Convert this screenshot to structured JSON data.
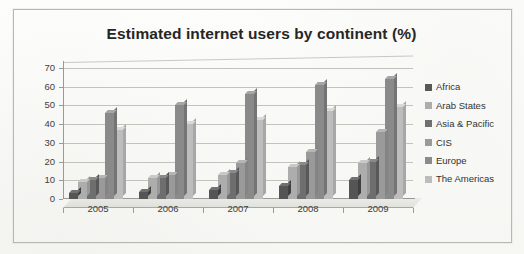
{
  "figure": {
    "title": "Estimated internet users by continent (%)"
  },
  "chart_data": {
    "type": "bar",
    "title": "Estimated internet users by continent (%)",
    "xlabel": "",
    "ylabel": "",
    "categories": [
      "2005",
      "2006",
      "2007",
      "2008",
      "2009"
    ],
    "ylim": [
      0,
      70
    ],
    "yticks": [
      0,
      10,
      20,
      30,
      40,
      50,
      60,
      70
    ],
    "ytick_labels": [
      "0",
      "10",
      "20",
      "30",
      "40",
      "50",
      "60",
      "70"
    ],
    "grid": true,
    "legend_position": "right",
    "series": [
      {
        "name": "Africa",
        "color": "#555555",
        "values": [
          3,
          4,
          5,
          7,
          10
        ]
      },
      {
        "name": "Arab States",
        "color": "#adadad",
        "values": [
          9,
          11,
          13,
          17,
          19
        ]
      },
      {
        "name": "Asia & Pacific",
        "color": "#6e6e6e",
        "values": [
          10,
          11,
          14,
          18,
          20
        ]
      },
      {
        "name": "CIS",
        "color": "#9a9a9a",
        "values": [
          11,
          13,
          19,
          25,
          36
        ]
      },
      {
        "name": "Europe",
        "color": "#8a8a8a",
        "values": [
          46,
          50,
          56,
          61,
          64
        ]
      },
      {
        "name": "The Americas",
        "color": "#bdbdbd",
        "values": [
          37,
          40,
          42,
          47,
          49
        ]
      }
    ]
  },
  "legend": {
    "items": [
      {
        "label": "Africa",
        "color": "#555555"
      },
      {
        "label": "Arab States",
        "color": "#adadad"
      },
      {
        "label": "Asia & Pacific",
        "color": "#6e6e6e"
      },
      {
        "label": "CIS",
        "color": "#9a9a9a"
      },
      {
        "label": "Europe",
        "color": "#8a8a8a"
      },
      {
        "label": "The Americas",
        "color": "#bdbdbd"
      }
    ]
  }
}
